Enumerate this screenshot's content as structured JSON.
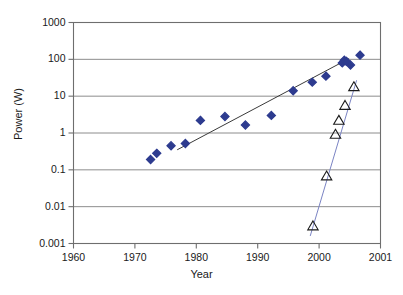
{
  "chart_data": {
    "type": "scatter",
    "title": "",
    "xlabel": "Year",
    "ylabel": "Power (W)",
    "yscale": "log",
    "ylim": [
      0.001,
      1000
    ],
    "xlim": [
      1960,
      2005
    ],
    "grid": "horizontal",
    "legend": "none",
    "ytick_labels": [
      "1000",
      "100",
      "10",
      "1",
      "0.1",
      "0.01",
      "0.001"
    ],
    "ytick_values": [
      1000,
      100,
      10,
      1,
      0.1,
      0.01,
      0.001
    ],
    "xtick_labels": [
      "1960",
      "1970",
      "1980",
      "1990",
      "2000",
      "2001"
    ],
    "xtick_positions": [
      1960,
      1969,
      1978,
      1987,
      1996,
      2005
    ],
    "series": [
      {
        "name": "filled-diamond-series",
        "marker": "diamond",
        "marker_style": "filled",
        "color": "#2d3b8f",
        "trendline": true,
        "trendline_color": "#3a3a3a",
        "points": [
          {
            "x": 1971.3,
            "y": 0.19
          },
          {
            "x": 1972.2,
            "y": 0.28
          },
          {
            "x": 1974.3,
            "y": 0.45
          },
          {
            "x": 1976.4,
            "y": 0.52
          },
          {
            "x": 1978.6,
            "y": 2.2
          },
          {
            "x": 1982.2,
            "y": 2.8
          },
          {
            "x": 1985.2,
            "y": 1.65
          },
          {
            "x": 1989.0,
            "y": 3.0
          },
          {
            "x": 1992.2,
            "y": 14.0
          },
          {
            "x": 1995.0,
            "y": 24.0
          },
          {
            "x": 1997.0,
            "y": 35.0
          },
          {
            "x": 1999.4,
            "y": 80.0
          },
          {
            "x": 1999.7,
            "y": 95.0
          },
          {
            "x": 2000.0,
            "y": 88.0
          },
          {
            "x": 2000.6,
            "y": 70.0
          },
          {
            "x": 2002.0,
            "y": 130.0
          }
        ],
        "trendline_from": {
          "x": 1975.2,
          "y": 0.35
        },
        "trendline_to": {
          "x": 2000.4,
          "y": 105.0
        }
      },
      {
        "name": "open-triangle-series",
        "marker": "triangle",
        "marker_style": "open",
        "color": "#1a1a1a",
        "trendline": true,
        "trendline_color": "#7b84c4",
        "points": [
          {
            "x": 1995.1,
            "y": 0.003
          },
          {
            "x": 1997.1,
            "y": 0.068
          },
          {
            "x": 1998.4,
            "y": 0.92
          },
          {
            "x": 1998.9,
            "y": 2.2
          },
          {
            "x": 1999.8,
            "y": 5.6
          },
          {
            "x": 2001.1,
            "y": 18.0
          }
        ],
        "trendline_from": {
          "x": 1994.7,
          "y": 0.0016
        },
        "trendline_to": {
          "x": 2001.5,
          "y": 27.0
        }
      }
    ]
  }
}
